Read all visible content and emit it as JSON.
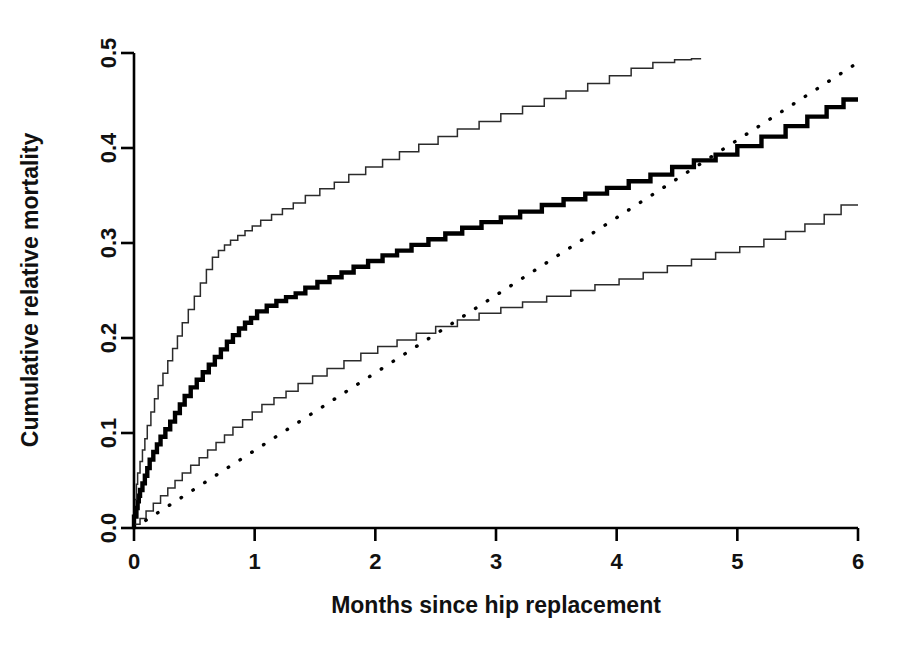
{
  "chart_data": {
    "type": "line",
    "title": "",
    "xlabel": "Months since hip replacement",
    "ylabel": "Cumulative relative mortality",
    "xlim": [
      0,
      6
    ],
    "ylim": [
      0.0,
      0.5
    ],
    "xticks": [
      0,
      1,
      2,
      3,
      4,
      5,
      6
    ],
    "xtick_labels": [
      "0",
      "1",
      "2",
      "3",
      "4",
      "5",
      "6"
    ],
    "yticks": [
      0.0,
      0.1,
      0.2,
      0.3,
      0.4,
      0.5
    ],
    "ytick_labels": [
      "0.0",
      "0.1",
      "0.2",
      "0.3",
      "0.4",
      "0.5"
    ],
    "grid": false,
    "legend": "none",
    "series": [
      {
        "name": "Cumulative relative mortality (estimate)",
        "style": "step",
        "line": "solid-bold",
        "color": "#000000",
        "x": [
          0.0,
          0.02,
          0.03,
          0.04,
          0.05,
          0.07,
          0.09,
          0.11,
          0.13,
          0.16,
          0.19,
          0.22,
          0.26,
          0.3,
          0.34,
          0.38,
          0.42,
          0.47,
          0.52,
          0.57,
          0.62,
          0.67,
          0.72,
          0.77,
          0.82,
          0.87,
          0.92,
          0.97,
          1.02,
          1.1,
          1.18,
          1.26,
          1.34,
          1.42,
          1.52,
          1.62,
          1.72,
          1.82,
          1.94,
          2.06,
          2.18,
          2.3,
          2.44,
          2.58,
          2.72,
          2.88,
          3.04,
          3.2,
          3.38,
          3.56,
          3.74,
          3.92,
          4.1,
          4.28,
          4.46,
          4.64,
          4.82,
          5.0,
          5.2,
          5.4,
          5.58,
          5.74,
          5.88,
          6.0
        ],
        "y": [
          0.0,
          0.012,
          0.021,
          0.028,
          0.034,
          0.04,
          0.047,
          0.055,
          0.063,
          0.072,
          0.08,
          0.088,
          0.096,
          0.104,
          0.112,
          0.121,
          0.13,
          0.139,
          0.148,
          0.156,
          0.164,
          0.172,
          0.18,
          0.188,
          0.196,
          0.203,
          0.21,
          0.216,
          0.221,
          0.228,
          0.234,
          0.239,
          0.243,
          0.247,
          0.253,
          0.259,
          0.264,
          0.269,
          0.275,
          0.281,
          0.287,
          0.292,
          0.298,
          0.304,
          0.31,
          0.316,
          0.322,
          0.327,
          0.333,
          0.34,
          0.346,
          0.352,
          0.358,
          0.365,
          0.372,
          0.38,
          0.387,
          0.393,
          0.402,
          0.412,
          0.423,
          0.433,
          0.443,
          0.451
        ]
      },
      {
        "name": "Upper 95% confidence limit",
        "style": "step",
        "line": "solid-thin",
        "color": "#2b2b2b",
        "x": [
          0.0,
          0.02,
          0.03,
          0.05,
          0.07,
          0.09,
          0.11,
          0.14,
          0.17,
          0.2,
          0.24,
          0.28,
          0.32,
          0.36,
          0.4,
          0.45,
          0.5,
          0.55,
          0.6,
          0.65,
          0.7,
          0.75,
          0.8,
          0.86,
          0.92,
          0.98,
          1.05,
          1.14,
          1.23,
          1.32,
          1.42,
          1.54,
          1.66,
          1.78,
          1.92,
          2.06,
          2.2,
          2.36,
          2.52,
          2.68,
          2.86,
          3.04,
          3.22,
          3.4,
          3.58,
          3.76,
          3.94,
          4.12,
          4.3,
          4.48,
          4.62,
          4.7
        ],
        "y": [
          0.0,
          0.03,
          0.046,
          0.058,
          0.07,
          0.082,
          0.094,
          0.108,
          0.122,
          0.136,
          0.15,
          0.163,
          0.176,
          0.189,
          0.202,
          0.216,
          0.23,
          0.244,
          0.258,
          0.272,
          0.285,
          0.292,
          0.298,
          0.303,
          0.308,
          0.313,
          0.318,
          0.324,
          0.33,
          0.336,
          0.342,
          0.35,
          0.357,
          0.364,
          0.372,
          0.38,
          0.388,
          0.396,
          0.404,
          0.412,
          0.42,
          0.428,
          0.436,
          0.444,
          0.452,
          0.46,
          0.468,
          0.476,
          0.484,
          0.49,
          0.493,
          0.494
        ]
      },
      {
        "name": "Lower 95% confidence limit",
        "style": "step",
        "line": "solid-thin",
        "color": "#2b2b2b",
        "x": [
          0.0,
          0.05,
          0.1,
          0.16,
          0.22,
          0.28,
          0.34,
          0.4,
          0.47,
          0.54,
          0.61,
          0.68,
          0.75,
          0.82,
          0.9,
          0.98,
          1.06,
          1.16,
          1.26,
          1.36,
          1.48,
          1.6,
          1.74,
          1.88,
          2.02,
          2.18,
          2.34,
          2.5,
          2.68,
          2.86,
          3.04,
          3.22,
          3.42,
          3.62,
          3.82,
          4.02,
          4.22,
          4.42,
          4.62,
          4.82,
          5.02,
          5.22,
          5.4,
          5.56,
          5.72,
          5.86,
          6.0
        ],
        "y": [
          0.0,
          0.004,
          0.01,
          0.018,
          0.026,
          0.034,
          0.042,
          0.05,
          0.058,
          0.066,
          0.074,
          0.082,
          0.09,
          0.098,
          0.106,
          0.114,
          0.122,
          0.13,
          0.137,
          0.144,
          0.152,
          0.16,
          0.168,
          0.176,
          0.184,
          0.191,
          0.198,
          0.205,
          0.212,
          0.219,
          0.226,
          0.232,
          0.238,
          0.244,
          0.25,
          0.256,
          0.262,
          0.269,
          0.276,
          0.283,
          0.29,
          0.296,
          0.304,
          0.312,
          0.32,
          0.33,
          0.34
        ]
      },
      {
        "name": "Reference line",
        "style": "straight",
        "line": "dotted",
        "color": "#000000",
        "x": [
          0.0,
          6.0
        ],
        "y": [
          0.0,
          0.49
        ]
      }
    ]
  },
  "geometry": {
    "plot_left": 134,
    "plot_right": 858,
    "plot_bottom": 528,
    "plot_top": 53
  }
}
